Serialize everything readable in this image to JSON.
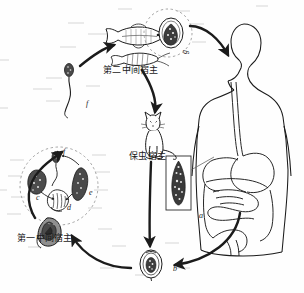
{
  "figure": {
    "type": "parasite-life-cycle",
    "background_color": "#fefefe",
    "ink_color": "#1b1b1b"
  },
  "labels": {
    "second_intermediate_host": "第二中间宿主",
    "first_intermediate_host": "第一中间宿主",
    "reservoir_host": "保虫宿主"
  },
  "stage_markers": {
    "a": "a",
    "b": "b",
    "c": "c",
    "d": "d",
    "e": "e",
    "f": "f",
    "f2": "f",
    "g": "g"
  },
  "elements": {
    "human_host": "human-body-outline",
    "digestive_tract": "digestive-tract",
    "adult_fluke_box": "adult-fluke-specimen",
    "egg": "operculated-egg",
    "snail": "snail-first-intermediate-host",
    "fish": "freshwater-fish",
    "shrimp": "freshwater-shrimp",
    "cat": "cat-reservoir-host",
    "cercaria": "cercaria",
    "miracidium": "miracidium",
    "sporocyst": "sporocyst",
    "redia": "redia",
    "metacercaria": "metacercaria"
  }
}
